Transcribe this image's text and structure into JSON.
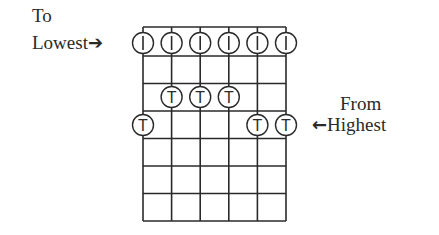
{
  "diagram": {
    "labels": {
      "to_line1": "To",
      "to_line2": "Lowest",
      "to_arrow": "➔",
      "from_line1": "From",
      "from_line2": "Highest",
      "from_arrow": "🡐"
    },
    "grid": {
      "strings": 6,
      "frets": 6,
      "string_x": [
        143,
        171.6,
        200.2,
        228.8,
        257.4,
        286
      ],
      "fret_y": [
        56,
        83.5,
        111,
        138.5,
        166,
        193.5,
        221
      ],
      "nut_top_y": 27
    },
    "open_markers": [
      {
        "string": 1,
        "symbol": "I"
      },
      {
        "string": 2,
        "symbol": "I"
      },
      {
        "string": 3,
        "symbol": "I"
      },
      {
        "string": 4,
        "symbol": "I"
      },
      {
        "string": 5,
        "symbol": "I"
      },
      {
        "string": 6,
        "symbol": "I"
      }
    ],
    "fretted_markers": [
      {
        "string": 2,
        "row_y": 97,
        "symbol": "T"
      },
      {
        "string": 3,
        "row_y": 97,
        "symbol": "T"
      },
      {
        "string": 4,
        "row_y": 97,
        "symbol": "T"
      },
      {
        "string": 1,
        "row_y": 125,
        "symbol": "T"
      },
      {
        "string": 5,
        "row_y": 125,
        "symbol": "T"
      },
      {
        "string": 6,
        "row_y": 125,
        "symbol": "T"
      }
    ],
    "colors": {
      "line": "#2a2a2a",
      "background": "#ffffff"
    }
  }
}
